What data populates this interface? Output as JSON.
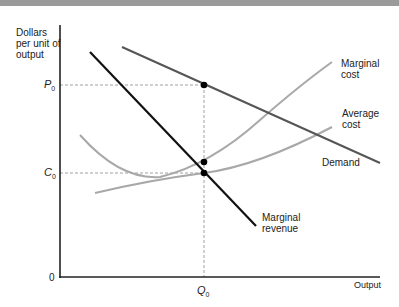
{
  "figure": {
    "y_axis_label": [
      "Dollars",
      "per unit of",
      "output"
    ],
    "x_axis_label": "Output",
    "origin_label": "0",
    "price_label": "P",
    "price_sub": "0",
    "cost_label": "C",
    "cost_sub": "0",
    "quantity_label": "Q",
    "quantity_sub": "0",
    "curves": {
      "marginal_cost": [
        "Marginal",
        "cost"
      ],
      "average_cost": [
        "Average",
        "cost"
      ],
      "demand": "Demand",
      "marginal_revenue": [
        "Marginal",
        "revenue"
      ]
    },
    "colors": {
      "demand": "#555555",
      "marginal_revenue": "#111111",
      "marginal_cost": "#a8a8a8",
      "average_cost": "#a8a8a8",
      "guides": "#888888",
      "axes": "#222222"
    }
  }
}
